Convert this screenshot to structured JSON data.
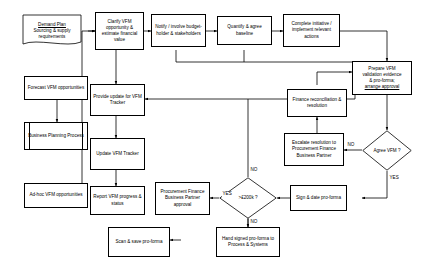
{
  "diagram": {
    "nodes": [
      {
        "id": "demand-plan",
        "shape": "document",
        "line1": "Demand Plan",
        "line2": "Sourcing & supply",
        "line3": "requirements"
      },
      {
        "id": "clarify-vfm",
        "shape": "process",
        "text": "Clarify VFM opportunity & estimate financial value"
      },
      {
        "id": "notify-involve",
        "shape": "process",
        "text": "Notify / involve budget-holder & stakeholders"
      },
      {
        "id": "quantify-agree",
        "shape": "process",
        "text": "Quantify & agree baseline"
      },
      {
        "id": "complete-initiative",
        "shape": "process",
        "text": "Complete initiative / implement relevant actions"
      },
      {
        "id": "prepare-vfm",
        "shape": "process",
        "line1": "Prepare VFM",
        "line2": "validation evidence",
        "line3": "& pro-forma;",
        "line4": "arrange approval"
      },
      {
        "id": "forecast-vfm",
        "shape": "process",
        "text": "Forecast VFM opportunities"
      },
      {
        "id": "business-planning",
        "shape": "predefined-process",
        "text": "Business Planning Process"
      },
      {
        "id": "ad-hoc-vfm",
        "shape": "process",
        "text": "Ad-hoc VFM opportunities"
      },
      {
        "id": "provide-update",
        "shape": "process",
        "text": "Provide update for VFM Tracker"
      },
      {
        "id": "update-tracker",
        "shape": "process",
        "text": "Update VFM Tracker"
      },
      {
        "id": "report-progress",
        "shape": "process",
        "text": "Report VFM progress & status"
      },
      {
        "id": "finance-reconciliation",
        "shape": "process",
        "text": "Finance reconciliation & resolution"
      },
      {
        "id": "escalate-resolution",
        "shape": "process",
        "text": "Escalate resolution to Procurement Finance Business Partner"
      },
      {
        "id": "agree-vfm",
        "shape": "decision",
        "text": "Agree VFM ?"
      },
      {
        "id": "sign-date",
        "shape": "process",
        "text": "Sign & date pro-forma"
      },
      {
        "id": "over-200k",
        "shape": "decision",
        "text": ">£200k ?"
      },
      {
        "id": "procurement-approval",
        "shape": "process",
        "text": "Procurement Finance Business Partner approval"
      },
      {
        "id": "hand-signed",
        "shape": "process",
        "text": "Hand signed pro-forma to Process & Systems"
      },
      {
        "id": "scan-save",
        "shape": "process",
        "text": "Scan & save pro-forma"
      }
    ],
    "edge_labels": {
      "agree_vfm_no": "NO",
      "agree_vfm_yes": "YES",
      "over200k_no_top": "NO",
      "over200k_yes": "YES",
      "over200k_no_bottom": "NO"
    },
    "colors": {
      "line": "#000000",
      "fill": "#ffffff",
      "text": "#000000"
    }
  }
}
